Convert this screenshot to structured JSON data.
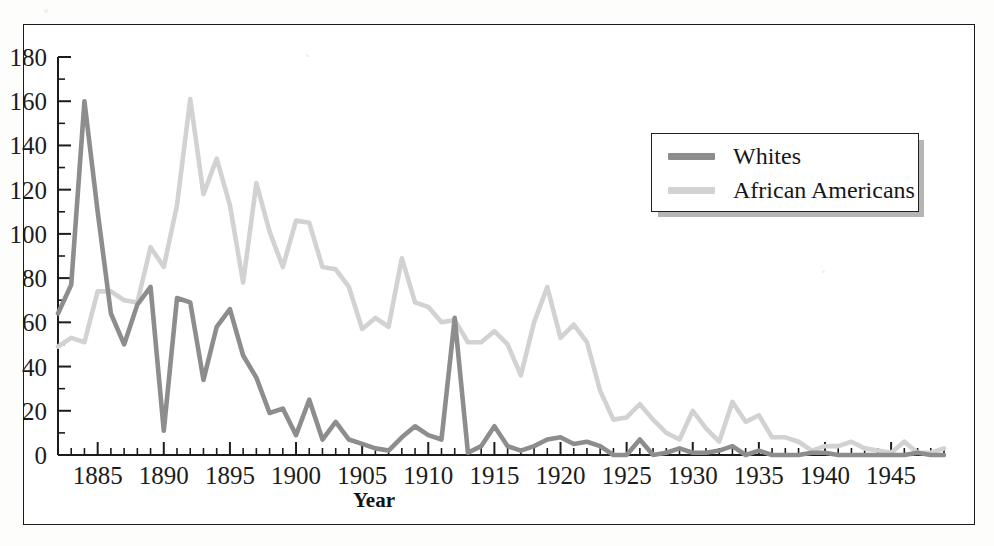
{
  "figure": {
    "frame_border_color": "#1b1b1b",
    "background_color": "#ffffff",
    "axis_color": "#1c1c1c"
  },
  "legend": {
    "position": "inside-top-right",
    "entries": [
      {
        "label": "Whites",
        "color": "#8d8d8d",
        "swatch_name": "legend-swatch-whites"
      },
      {
        "label": "African Americans",
        "color": "#d2d2d2",
        "swatch_name": "legend-swatch-african-americans"
      }
    ]
  },
  "axes": {
    "x": {
      "title": "Year",
      "min": 1882,
      "max": 1949,
      "major_tick_step": 5,
      "minor_tick_step": 1,
      "tick_labels": [
        "1885",
        "1890",
        "1895",
        "1900",
        "1905",
        "1910",
        "1915",
        "1920",
        "1925",
        "1930",
        "1935",
        "1940",
        "1945"
      ],
      "tick_label_values": [
        1885,
        1890,
        1895,
        1900,
        1905,
        1910,
        1915,
        1920,
        1925,
        1930,
        1935,
        1940,
        1945
      ]
    },
    "y": {
      "title": "",
      "min": 0,
      "max": 180,
      "major_tick_step": 20,
      "minor_tick_step": 10,
      "tick_labels": [
        "0",
        "20",
        "40",
        "60",
        "80",
        "100",
        "120",
        "140",
        "160",
        "180"
      ],
      "tick_label_values": [
        0,
        20,
        40,
        60,
        80,
        100,
        120,
        140,
        160,
        180
      ]
    }
  },
  "chart_data": {
    "type": "line",
    "title": "",
    "subtitle": "",
    "xlabel": "Year",
    "ylabel": "",
    "xlim": [
      1882,
      1949
    ],
    "ylim": [
      0,
      180
    ],
    "grid": false,
    "legend_position": "inside-top-right",
    "x": [
      1882,
      1883,
      1884,
      1885,
      1886,
      1887,
      1888,
      1889,
      1890,
      1891,
      1892,
      1893,
      1894,
      1895,
      1896,
      1897,
      1898,
      1899,
      1900,
      1901,
      1902,
      1903,
      1904,
      1905,
      1906,
      1907,
      1908,
      1909,
      1910,
      1911,
      1912,
      1913,
      1914,
      1915,
      1916,
      1917,
      1918,
      1919,
      1920,
      1921,
      1922,
      1923,
      1924,
      1925,
      1926,
      1927,
      1928,
      1929,
      1930,
      1931,
      1932,
      1933,
      1934,
      1935,
      1936,
      1937,
      1938,
      1939,
      1940,
      1941,
      1942,
      1943,
      1944,
      1945,
      1946,
      1947,
      1948,
      1949
    ],
    "series": [
      {
        "name": "Whites",
        "color": "#8d8d8d",
        "values": [
          64,
          77,
          160,
          110,
          64,
          50,
          68,
          76,
          11,
          71,
          69,
          34,
          58,
          66,
          45,
          35,
          19,
          21,
          9,
          25,
          7,
          15,
          7,
          5,
          3,
          2,
          8,
          13,
          9,
          7,
          62,
          1,
          4,
          13,
          4,
          2,
          4,
          7,
          8,
          5,
          6,
          4,
          0,
          0,
          7,
          0,
          1,
          3,
          1,
          1,
          2,
          4,
          0,
          2,
          0,
          0,
          0,
          1,
          1,
          0,
          0,
          0,
          0,
          0,
          0,
          1,
          0,
          0
        ]
      },
      {
        "name": "African Americans",
        "color": "#d2d2d2",
        "values": [
          49,
          53,
          51,
          74,
          74,
          70,
          69,
          94,
          85,
          113,
          161,
          118,
          134,
          113,
          78,
          123,
          101,
          85,
          106,
          105,
          85,
          84,
          76,
          57,
          62,
          58,
          89,
          69,
          67,
          60,
          61,
          51,
          51,
          56,
          50,
          36,
          60,
          76,
          53,
          59,
          51,
          29,
          16,
          17,
          23,
          16,
          10,
          7,
          20,
          12,
          6,
          24,
          15,
          18,
          8,
          8,
          6,
          2,
          4,
          4,
          6,
          3,
          2,
          1,
          6,
          1,
          1,
          3
        ]
      }
    ]
  }
}
